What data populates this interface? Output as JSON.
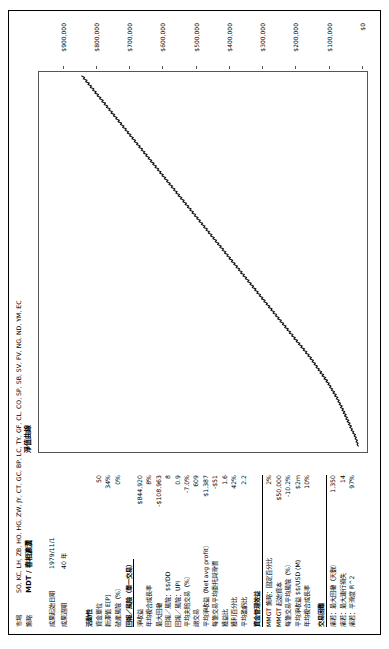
{
  "header": {
    "market_key": "市場",
    "market_value": "SO, KC, LH, ZB, HO, HG, ZW, JY, CT, GC, BP, LC, TY, GF, CL, CO, SP, SB, SV, FV, NG, ND, YM, EC",
    "strategy_key": "策略",
    "strategy_value": "MDT / 春相瀌瀷"
  },
  "period": {
    "start_key": "成果起始日期",
    "start_value": "1979/11/1",
    "length_key": "成果週期",
    "length_value": "40 年"
  },
  "sections": [
    {
      "id": "activity",
      "title": "活動性",
      "underline": false,
      "rows": [
        {
          "label": "資金單位",
          "value": "50"
        },
        {
          "label": "新澤值 E[P]",
          "value": "34%"
        },
        {
          "label": "破產風險（%）",
          "value": "0%"
        }
      ]
    },
    {
      "id": "rr",
      "title": "回報／風險（單一交易）",
      "underline": true,
      "rows": [
        {
          "label": "淨收益",
          "value": "$844,920"
        },
        {
          "label": "年均複合成長率",
          "value": "8%"
        },
        {
          "label": "最大回撤",
          "value": "-$108,963"
        },
        {
          "label": "回報／風險：$$/DD",
          "value": "8"
        },
        {
          "label": "回報／風險：UPI",
          "value": "0.9"
        },
        {
          "label": "平均夫賠交易（%）",
          "value": "-7.0%"
        },
        {
          "label": "總交易",
          "value": "609"
        },
        {
          "label": "平均淨收益（Net avg profit）",
          "value": "$1,387"
        },
        {
          "label": "每筆交易平均委托與滑價",
          "value": "-$51"
        },
        {
          "label": "獲益比",
          "value": "1.6"
        },
        {
          "label": "獲利百分比",
          "value": "42%"
        },
        {
          "label": "平均盈虧比",
          "value": "2.2"
        }
      ]
    },
    {
      "id": "mm",
      "title": "資金管理效益",
      "underline": false,
      "rows": [
        {
          "label": "MMGT 策略：固定百分比",
          "value": "2%"
        },
        {
          "label": "MMGT 起始資本",
          "value": "$50,000"
        },
        {
          "label": "每筆交易平均風險（%）",
          "value": "-10.2%"
        },
        {
          "label": "平均淨收益 $$/USD (M)",
          "value": "$2m"
        },
        {
          "label": "年均複合成長率",
          "value": "10%"
        }
      ]
    },
    {
      "id": "diff",
      "title": "交易困難",
      "underline": false,
      "rows": [
        {
          "label": "痛若：最大回撤（天數）",
          "value": "1,350"
        },
        {
          "label": "痛若：最大連行損失",
          "value": "14"
        },
        {
          "label": "痛若：平滑度 R^2",
          "value": "97%"
        }
      ]
    }
  ],
  "chart_data": {
    "type": "line",
    "title": "淨值曲線",
    "xlabel": "",
    "ylabel": "",
    "ylim": [
      0,
      950000
    ],
    "grid": false,
    "legend": "none",
    "yticks": [
      0,
      100000,
      200000,
      300000,
      400000,
      500000,
      600000,
      700000,
      800000,
      900000
    ],
    "ytick_labels": [
      "$0",
      "$100,000",
      "$200,000",
      "$300,000",
      "$400,000",
      "$500,000",
      "$600,000",
      "$700,000",
      "$800,000",
      "$900,000"
    ],
    "series": [
      {
        "name": "淨值曲線",
        "values": [
          8000,
          12000,
          9000,
          15000,
          11000,
          18000,
          14000,
          21000,
          17000,
          25000,
          22000,
          30000,
          26000,
          34000,
          29000,
          38000,
          33000,
          42000,
          37000,
          46000,
          41000,
          50000,
          45000,
          54000,
          49000,
          58000,
          53000,
          62000,
          57000,
          66000,
          62000,
          70000,
          66000,
          75000,
          70000,
          80000,
          75000,
          85000,
          80000,
          90000,
          86000,
          95000,
          91000,
          100000,
          96000,
          106000,
          101000,
          112000,
          107000,
          118000,
          113000,
          124000,
          119000,
          130000,
          126000,
          136000,
          132000,
          142000,
          138000,
          148000,
          144000,
          154000,
          150000,
          161000,
          157000,
          168000,
          164000,
          175000,
          171000,
          182000,
          178000,
          189000,
          185000,
          196000,
          192000,
          203000,
          199000,
          210000,
          206000,
          217000,
          213000,
          224000,
          220000,
          231000,
          227000,
          238000,
          234000,
          245000,
          241000,
          252000,
          248000,
          259000,
          255000,
          266000,
          262000,
          273000,
          269000,
          280000,
          276000,
          287000,
          283000,
          294000,
          290000,
          301000,
          297000,
          308000,
          304000,
          315000,
          311000,
          322000,
          318000,
          329000,
          325000,
          336000,
          332000,
          343000,
          339000,
          350000,
          346000,
          357000,
          353000,
          364000,
          360000,
          371000,
          367000,
          378000,
          374000,
          385000,
          381000,
          392000,
          388000,
          399000,
          395000,
          406000,
          402000,
          413000,
          409000,
          420000,
          416000,
          427000,
          423000,
          434000,
          430000,
          441000,
          437000,
          448000,
          444000,
          455000,
          451000,
          462000,
          458000,
          469000,
          465000,
          476000,
          472000,
          483000,
          479000,
          490000,
          486000,
          497000,
          493000,
          504000,
          500000,
          511000,
          507000,
          518000,
          514000,
          525000,
          521000,
          532000,
          528000,
          539000,
          535000,
          546000,
          542000,
          553000,
          549000,
          560000,
          556000,
          567000,
          563000,
          574000,
          570000,
          581000,
          577000,
          588000,
          584000,
          595000,
          591000,
          602000,
          598000,
          609000,
          605000,
          616000,
          612000,
          623000,
          619000,
          630000,
          626000,
          637000,
          633000,
          644000,
          640000,
          651000,
          647000,
          658000,
          654000,
          665000,
          661000,
          672000,
          668000,
          679000,
          675000,
          686000,
          682000,
          693000,
          689000,
          700000,
          696000,
          707000,
          703000,
          714000,
          710000,
          721000,
          717000,
          728000,
          724000,
          735000,
          731000,
          742000,
          738000,
          749000,
          745000,
          756000,
          752000,
          763000,
          759000,
          770000,
          766000,
          777000,
          773000,
          784000,
          780000,
          791000,
          787000,
          798000,
          794000,
          805000,
          801000,
          812000,
          808000,
          819000,
          815000,
          826000,
          822000,
          833000,
          829000,
          840000,
          836000,
          845000
        ]
      }
    ]
  }
}
